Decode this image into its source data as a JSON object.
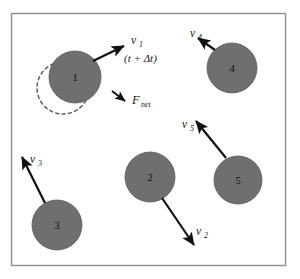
{
  "figure": {
    "background_color": "#ffffff",
    "frame": {
      "stroke_color": "#8d8d8d",
      "fill_color": "#ffffff",
      "x": 11,
      "y": 13,
      "width": 274,
      "height": 252
    },
    "disk_color": "#6f6f6f",
    "disk_stroke_color": "#5a5a5a",
    "arrow_color": "#111111",
    "dashed_circle_color": "#5f5f5f"
  },
  "disks": [
    {
      "id": "disk-1",
      "label": "1",
      "cx": 75,
      "cy": 77,
      "r": 26
    },
    {
      "id": "disk-2",
      "label": "2",
      "cx": 150,
      "cy": 177,
      "r": 25
    },
    {
      "id": "disk-3",
      "label": "3",
      "cx": 57,
      "cy": 225,
      "r": 25
    },
    {
      "id": "disk-4",
      "label": "4",
      "cx": 232,
      "cy": 68,
      "r": 25
    },
    {
      "id": "disk-5",
      "label": "5",
      "cx": 238,
      "cy": 180,
      "r": 24
    }
  ],
  "ghost_disk": {
    "id": "ghost-disk-1",
    "cx": 63,
    "cy": 88,
    "r": 26,
    "style": "dashed"
  },
  "vectors": [
    {
      "id": "v1",
      "symbol": "v",
      "subscript": "1",
      "label_x": 131,
      "label_y": 44,
      "sub_x": 139,
      "sub_y": 47,
      "x1": 93,
      "y1": 61,
      "x2": 124,
      "y2": 46
    },
    {
      "id": "v2",
      "symbol": "v",
      "subscript": "2",
      "label_x": 196,
      "label_y": 235,
      "sub_x": 204,
      "sub_y": 238,
      "x1": 162,
      "y1": 198,
      "x2": 194,
      "y2": 245
    },
    {
      "id": "v3",
      "symbol": "v",
      "subscript": "3",
      "label_x": 30,
      "label_y": 163,
      "sub_x": 38,
      "sub_y": 166,
      "x1": 45,
      "y1": 203,
      "x2": 22,
      "y2": 157
    },
    {
      "id": "v4",
      "symbol": "v",
      "subscript": "4",
      "label_x": 190,
      "label_y": 37,
      "sub_x": 198,
      "sub_y": 40,
      "x1": 215,
      "y1": 50,
      "x2": 198,
      "y2": 38
    },
    {
      "id": "v5",
      "symbol": "v",
      "subscript": "5",
      "label_x": 182,
      "label_y": 128,
      "sub_x": 190,
      "sub_y": 131,
      "x1": 226,
      "y1": 158,
      "x2": 196,
      "y2": 121
    }
  ],
  "force": {
    "id": "F_net",
    "symbol": "F",
    "subscript": "net",
    "label_x": 132,
    "label_y": 104,
    "sub_x": 140,
    "sub_y": 107,
    "x1": 113,
    "y1": 92,
    "x2": 124,
    "y2": 100
  },
  "time_label": {
    "text": "(t + Δt)",
    "x": 124,
    "y": 62
  }
}
